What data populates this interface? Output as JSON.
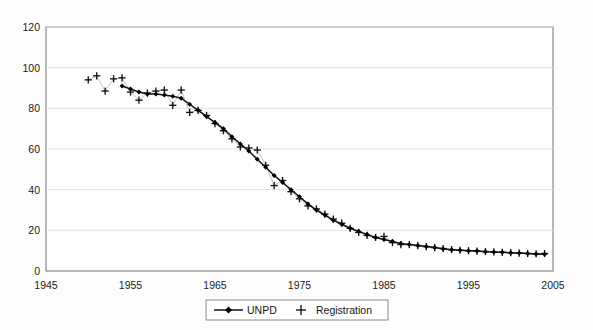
{
  "chart_data": {
    "type": "line",
    "title": "",
    "subtitle": "",
    "xlabel": "",
    "ylabel": "",
    "xlim": [
      1945,
      2005
    ],
    "ylim": [
      0,
      120
    ],
    "x_ticks": [
      1945,
      1955,
      1965,
      1975,
      1985,
      1995,
      2005
    ],
    "y_ticks": [
      0,
      20,
      40,
      60,
      80,
      100,
      120
    ],
    "grid": "horizontal",
    "legend_position": "bottom-center",
    "legend": [
      "UNPD",
      "Registration"
    ],
    "series": [
      {
        "name": "UNPD",
        "marker": "diamond",
        "line": true,
        "color": "#111111",
        "x": [
          1954,
          1955,
          1956,
          1957,
          1958,
          1959,
          1960,
          1961,
          1962,
          1963,
          1964,
          1965,
          1966,
          1967,
          1968,
          1969,
          1970,
          1971,
          1972,
          1973,
          1974,
          1975,
          1976,
          1977,
          1978,
          1979,
          1980,
          1981,
          1982,
          1983,
          1984,
          1985,
          1986,
          1987,
          1988,
          1989,
          1990,
          1991,
          1992,
          1993,
          1994,
          1995,
          1996,
          1997,
          1998,
          1999,
          2000,
          2001,
          2002,
          2003,
          2004
        ],
        "y": [
          91.0,
          89.5,
          88.0,
          87.0,
          87.0,
          86.5,
          86.0,
          85.0,
          82.0,
          79.0,
          76.0,
          73.0,
          70.0,
          66.0,
          62.5,
          59.0,
          55.0,
          51.0,
          47.0,
          43.5,
          40.0,
          36.5,
          33.0,
          30.0,
          27.5,
          25.0,
          23.0,
          21.0,
          19.5,
          18.0,
          16.5,
          15.5,
          14.5,
          13.5,
          13.0,
          12.5,
          12.0,
          11.5,
          11.0,
          10.5,
          10.2,
          10.0,
          9.8,
          9.5,
          9.3,
          9.2,
          9.0,
          8.8,
          8.6,
          8.4,
          8.2
        ]
      },
      {
        "name": "Registration",
        "marker": "plus",
        "line": false,
        "color": "#111111",
        "x": [
          1950,
          1951,
          1952,
          1953,
          1954,
          1955,
          1956,
          1957,
          1958,
          1959,
          1960,
          1961,
          1962,
          1963,
          1964,
          1965,
          1966,
          1967,
          1968,
          1969,
          1970,
          1971,
          1972,
          1973,
          1974,
          1975,
          1976,
          1977,
          1978,
          1979,
          1980,
          1981,
          1982,
          1983,
          1984,
          1985,
          1986,
          1987,
          1988,
          1989,
          1990,
          1991,
          1992,
          1993,
          1994,
          1995,
          1996,
          1997,
          1998,
          1999,
          2000,
          2001,
          2002,
          2003,
          2004
        ],
        "y": [
          94.0,
          96.0,
          88.5,
          94.5,
          95.0,
          88.0,
          84.0,
          87.5,
          88.5,
          89.0,
          81.5,
          89.0,
          78.0,
          79.0,
          76.5,
          72.5,
          69.0,
          65.0,
          61.0,
          60.5,
          59.5,
          52.0,
          42.0,
          44.5,
          39.0,
          35.5,
          32.0,
          30.5,
          28.0,
          25.5,
          23.5,
          21.0,
          19.0,
          17.5,
          16.5,
          17.0,
          14.0,
          13.0,
          13.0,
          12.5,
          12.0,
          11.5,
          11.0,
          10.5,
          10.2,
          10.0,
          9.8,
          9.6,
          9.4,
          9.2,
          9.0,
          8.8,
          8.6,
          8.4,
          8.6
        ]
      }
    ]
  },
  "axes": {
    "y_tick_labels": [
      "0",
      "20",
      "40",
      "60",
      "80",
      "100",
      "120"
    ],
    "x_tick_labels": [
      "1945",
      "1955",
      "1965",
      "1975",
      "1985",
      "1995",
      "2005"
    ]
  },
  "legend": {
    "entries": [
      {
        "label": "UNPD",
        "marker": "diamond-line"
      },
      {
        "label": "Registration",
        "marker": "plus"
      }
    ]
  },
  "colors": {
    "series": "#111111",
    "grid": "#e2e2e2",
    "frame": "#7d7d7d",
    "background": "#ffffff"
  }
}
